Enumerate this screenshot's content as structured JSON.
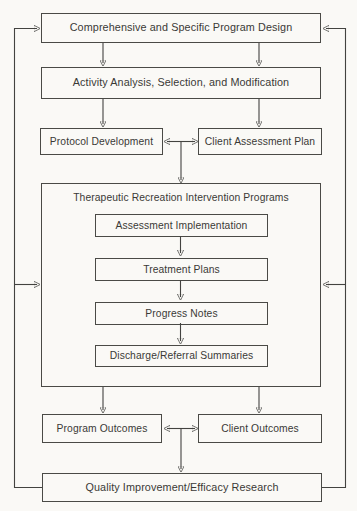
{
  "figure": {
    "colors": {
      "background": "#faf9f6",
      "line": "#434340",
      "text": "#3a3a36"
    },
    "nodes": {
      "program_design": "Comprehensive and Specific Program Design",
      "activity_analysis": "Activity Analysis, Selection, and Modification",
      "protocol_development": "Protocol Development",
      "client_assessment_plan": "Client Assessment Plan",
      "intervention_programs": "Therapeutic Recreation Intervention Programs",
      "assessment_implementation": "Assessment Implementation",
      "treatment_plans": "Treatment Plans",
      "progress_notes": "Progress Notes",
      "discharge_referral_summaries": "Discharge/Referral Summaries",
      "program_outcomes": "Program Outcomes",
      "client_outcomes": "Client Outcomes",
      "quality_improvement": "Quality Improvement/Efficacy Research"
    }
  }
}
